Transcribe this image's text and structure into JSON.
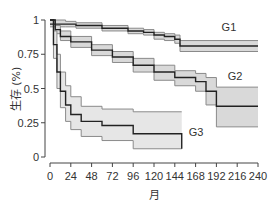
{
  "chart_data": {
    "type": "line",
    "subtype": "kaplan-meier survival curve with confidence bands",
    "title": "",
    "xlabel": "月",
    "ylabel": "生存 (%)",
    "xlim": [
      0,
      240
    ],
    "ylim": [
      0,
      1
    ],
    "x_ticks": [
      0,
      24,
      48,
      72,
      96,
      120,
      144,
      168,
      192,
      216,
      240
    ],
    "y_ticks": [
      0,
      0.25,
      0.5,
      0.75,
      1
    ],
    "y_tick_labels": [
      "0",
      "0.25",
      "0.5",
      "0.75",
      "1"
    ],
    "grid": false,
    "legend": "inline labels",
    "series": [
      {
        "name": "G1",
        "color": "#222222",
        "band_color": "#d9d9d9",
        "x": [
          0,
          18,
          30,
          60,
          90,
          108,
          120,
          132,
          144,
          150,
          240
        ],
        "values": [
          0.97,
          0.97,
          0.96,
          0.94,
          0.92,
          0.91,
          0.89,
          0.88,
          0.86,
          0.81,
          0.81
        ],
        "upper": [
          1.0,
          0.99,
          0.98,
          0.96,
          0.94,
          0.93,
          0.91,
          0.9,
          0.89,
          0.85,
          0.85
        ],
        "lower": [
          0.95,
          0.95,
          0.94,
          0.92,
          0.9,
          0.89,
          0.86,
          0.85,
          0.83,
          0.77,
          0.77
        ]
      },
      {
        "name": "G2",
        "color": "#222222",
        "band_color": "#d9d9d9",
        "x": [
          0,
          6,
          12,
          24,
          48,
          72,
          96,
          120,
          144,
          168,
          180,
          192,
          240
        ],
        "values": [
          1.0,
          0.93,
          0.88,
          0.84,
          0.78,
          0.73,
          0.67,
          0.62,
          0.58,
          0.55,
          0.48,
          0.37,
          0.37
        ],
        "upper": [
          1.0,
          0.96,
          0.92,
          0.88,
          0.82,
          0.77,
          0.72,
          0.67,
          0.63,
          0.61,
          0.58,
          0.51,
          0.51
        ],
        "lower": [
          1.0,
          0.9,
          0.85,
          0.8,
          0.74,
          0.69,
          0.62,
          0.56,
          0.52,
          0.48,
          0.38,
          0.22,
          0.22
        ]
      },
      {
        "name": "G3",
        "color": "#222222",
        "band_color": "#e6e6e6",
        "x": [
          0,
          4,
          8,
          12,
          18,
          24,
          36,
          60,
          96,
          150,
          152
        ],
        "values": [
          1.0,
          0.82,
          0.62,
          0.48,
          0.38,
          0.31,
          0.26,
          0.23,
          0.17,
          0.17,
          0.06
        ],
        "upper": [
          1.0,
          0.92,
          0.75,
          0.62,
          0.52,
          0.44,
          0.37,
          0.35,
          0.33,
          0.33,
          0.33
        ],
        "lower": [
          1.0,
          0.72,
          0.5,
          0.36,
          0.26,
          0.2,
          0.15,
          0.12,
          0.06,
          0.06,
          0.06
        ]
      }
    ],
    "annotations": [
      {
        "text": "G1",
        "x": 198,
        "y": 0.92
      },
      {
        "text": "G2",
        "x": 205,
        "y": 0.56
      },
      {
        "text": "G3",
        "x": 160,
        "y": 0.15
      }
    ]
  }
}
